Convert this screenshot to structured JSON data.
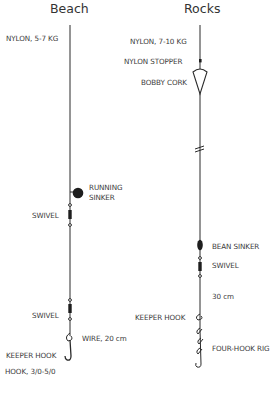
{
  "diagram": {
    "columns": [
      {
        "title": "Beach",
        "labels": {
          "line": "NYLON, 5-7 KG",
          "sinker": "RUNNING",
          "sinker2": "SINKER",
          "swivel1": "SWIVEL",
          "swivel2": "SWIVEL",
          "wire": "WIRE, 20 cm",
          "keeper": "KEEPER HOOK",
          "hook": "HOOK, 3/0-5/0"
        }
      },
      {
        "title": "Rocks",
        "labels": {
          "line": "NYLON, 7-10 KG",
          "stopper": "NYLON STOPPER",
          "cork": "BOBBY CORK",
          "sinker": "BEAN SINKER",
          "swivel": "SWIVEL",
          "length": "30 cm",
          "keeper": "KEEPER HOOK",
          "rig": "FOUR-HOOK RIG"
        }
      }
    ],
    "colors": {
      "line": "#2a2a2a",
      "text": "#3a3a3a",
      "background": "#ffffff"
    }
  }
}
